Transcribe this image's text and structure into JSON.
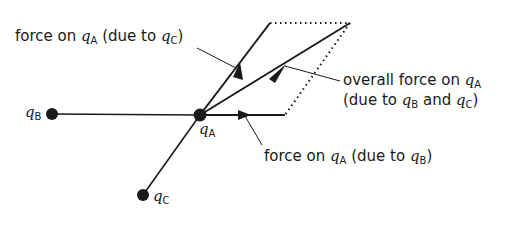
{
  "diagram": {
    "charges": [
      {
        "id": "qB",
        "symbol": "q",
        "subscript": "B",
        "x": 52,
        "y": 114
      },
      {
        "id": "qA",
        "symbol": "q",
        "subscript": "A",
        "x": 200,
        "y": 115
      },
      {
        "id": "qC",
        "symbol": "q",
        "subscript": "C",
        "x": 143,
        "y": 195
      }
    ],
    "labels": {
      "force_c": {
        "prefix": "force on ",
        "q1": "q",
        "s1": "A",
        "mid": " (due to ",
        "q2": "q",
        "s2": "C",
        "suffix": ")"
      },
      "force_b": {
        "prefix": "force on ",
        "q1": "q",
        "s1": "A",
        "mid": " (due to ",
        "q2": "q",
        "s2": "B",
        "suffix": ")"
      },
      "overall_line1": {
        "prefix": "overall force on ",
        "q1": "q",
        "s1": "A"
      },
      "overall_line2": {
        "prefix": "(due to ",
        "q1": "q",
        "s1": "B",
        "mid": " and ",
        "q2": "q",
        "s2": "C",
        "suffix": ")"
      }
    },
    "colors": {
      "line": "#1a1a1a",
      "background": "#ffffff"
    }
  }
}
